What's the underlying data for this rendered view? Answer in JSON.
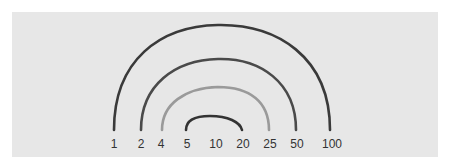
{
  "diagram": {
    "number_line": [
      "1",
      "2",
      "4",
      "5",
      "10",
      "20",
      "25",
      "50",
      "100"
    ],
    "arcs": [
      {
        "from": "1",
        "to": "100",
        "color": "#3a3a3a"
      },
      {
        "from": "2",
        "to": "50",
        "color": "#4a4a4a"
      },
      {
        "from": "4",
        "to": "25",
        "color": "#9a9a9a"
      },
      {
        "from": "5",
        "to": "20",
        "color": "#333333"
      }
    ],
    "background": "#e7e7e7"
  }
}
